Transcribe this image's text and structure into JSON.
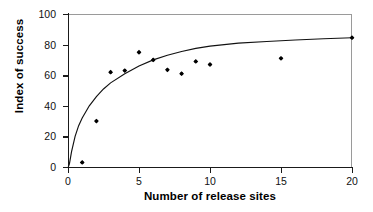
{
  "chart_data": {
    "type": "scatter",
    "title": "",
    "xlabel": "Number of release sites",
    "ylabel": "Index of success",
    "xlim": [
      0,
      20
    ],
    "ylim": [
      0,
      100
    ],
    "xticks": [
      0,
      5,
      10,
      15,
      20
    ],
    "yticks": [
      0,
      20,
      40,
      60,
      80,
      100
    ],
    "xtick_labels": [
      "0",
      "5",
      "10",
      "15",
      "20"
    ],
    "ytick_labels": [
      "0",
      "20",
      "40",
      "60",
      "80",
      "100"
    ],
    "grid": false,
    "legend": null,
    "marker_color": "#000000",
    "curve_color": "#111111",
    "frame_color": "#9a9a9a",
    "axis_color": "#1a1a1a",
    "series": [
      {
        "name": "observations",
        "marker": "filled-diamond",
        "x": [
          1,
          2,
          3,
          4,
          5,
          6,
          7,
          8,
          9,
          10,
          15,
          20
        ],
        "y": [
          3,
          30,
          62,
          63,
          75,
          70,
          63.5,
          61,
          69,
          67,
          71,
          84.5
        ]
      }
    ],
    "fit_curve": {
      "name": "logarithmic fit",
      "equation": "y = 28.2 * ln(x) + 0.5",
      "x": [
        0.02,
        0.1,
        0.25,
        0.5,
        0.75,
        1,
        1.5,
        2,
        2.5,
        3,
        4,
        5,
        6,
        7,
        8,
        9,
        10,
        12,
        14,
        16,
        18,
        20
      ],
      "y": [
        0,
        2,
        10,
        20,
        27,
        32,
        40,
        46,
        51,
        55,
        61,
        66,
        70,
        73,
        75.5,
        77.5,
        79,
        81,
        82,
        83,
        83.8,
        84.5
      ]
    }
  },
  "axis": {
    "x_title": "Number of release sites",
    "y_title": "Index of success"
  }
}
